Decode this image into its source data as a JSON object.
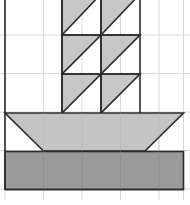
{
  "figure": {
    "title": "Sailboat tangram pattern on grid",
    "type": "geometric-composition",
    "canvas": {
      "width": 190,
      "height": 205
    },
    "colors": {
      "background": "#ffffff",
      "grid_line": "#d8d8d8",
      "outline": "#2b2b2b",
      "sail_fill": "#c7c7c7",
      "hull_fill": "#c4c4c4",
      "water_fill": "#9a9a9a"
    },
    "grid": {
      "cell_size": 38.5,
      "origin_x": 5,
      "origin_y": -3.5,
      "columns": 5,
      "rows": 6,
      "x_lines": [
        5,
        43.5,
        82,
        120.5,
        159,
        183.5
      ],
      "y_lines": [
        -3.5,
        35,
        73.5,
        112,
        150.5,
        189,
        205
      ]
    },
    "parts": {
      "sails": {
        "label": "Sails",
        "left_x": 62,
        "mid_x": 101,
        "right_x": 140,
        "row_y": [
          -3.5,
          35,
          74,
          113
        ],
        "count": 6,
        "triangle_orientation": "right-angle-top-left-hypotenuse-to-bottom-right"
      },
      "hull_top": {
        "label": "Hull deck",
        "shape": "trapezoid",
        "points": "5,113 183.5,113 145,151 43.5,151"
      },
      "hull_bottom": {
        "label": "Hull base / water band",
        "shape": "rectangle",
        "x": 5,
        "y": 151.5,
        "width": 178.5,
        "height": 38.5
      }
    }
  }
}
